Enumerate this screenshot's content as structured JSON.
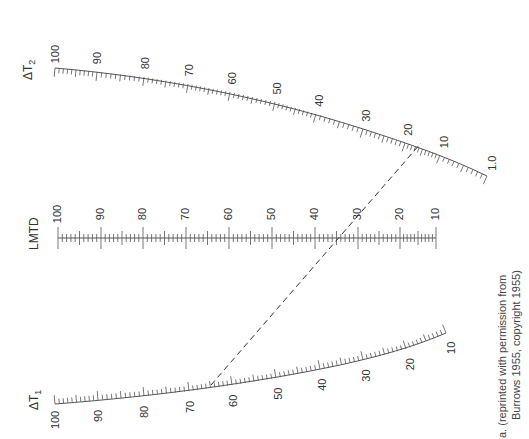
{
  "figure": {
    "type": "nomograph",
    "caption_line1": "a. (reprinted with permission from",
    "caption_line2": "Burrows 1955, copyright 1955)"
  },
  "scales": {
    "dt2": {
      "title": "ΔT",
      "subscript": "2",
      "labels": [
        "100",
        "90",
        "80",
        "70",
        "60",
        "50",
        "40",
        "30",
        "20",
        "10",
        "1.0"
      ]
    },
    "lmtd": {
      "title": "LMTD",
      "labels": [
        "100",
        "90",
        "80",
        "70",
        "60",
        "50",
        "40",
        "30",
        "20",
        "10"
      ]
    },
    "dt1": {
      "title": "ΔT",
      "subscript": "1",
      "labels": [
        "100",
        "90",
        "80",
        "70",
        "60",
        "50",
        "40",
        "30",
        "20",
        "10"
      ]
    }
  },
  "example_line": {
    "style": "dashed",
    "dt1_value": 65,
    "dt2_value": 14,
    "lmtd_value": 33
  },
  "colors": {
    "ink": "#333333",
    "background": "#ffffff"
  }
}
